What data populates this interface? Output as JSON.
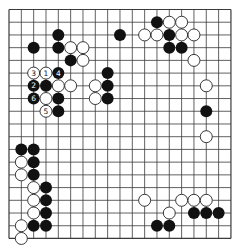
{
  "board": {
    "size": 19,
    "origin": [
      9,
      9.5
    ],
    "spacing": [
      12.33,
      12.72
    ],
    "stone_radius": 6,
    "colors": {
      "background": "#ffffff",
      "line": "#3a3a3a",
      "black_stone": "#111111",
      "white_stone": "#ffffff",
      "white_stroke": "#222222",
      "label_on_black": "#ffffff",
      "label_on_white": "#111111"
    }
  },
  "stones": {
    "black": [
      {
        "col": 12,
        "row": 1
      },
      {
        "col": 4,
        "row": 2
      },
      {
        "col": 9,
        "row": 2
      },
      {
        "col": 13,
        "row": 2
      },
      {
        "col": 2,
        "row": 3
      },
      {
        "col": 4,
        "row": 3
      },
      {
        "col": 13,
        "row": 3
      },
      {
        "col": 14,
        "row": 3
      },
      {
        "col": 5,
        "row": 4
      },
      {
        "col": 4,
        "row": 5,
        "label": "4"
      },
      {
        "col": 8,
        "row": 5
      },
      {
        "col": 2,
        "row": 6,
        "label": "2"
      },
      {
        "col": 3,
        "row": 6
      },
      {
        "col": 8,
        "row": 6
      },
      {
        "col": 2,
        "row": 7,
        "label": "6"
      },
      {
        "col": 4,
        "row": 7
      },
      {
        "col": 8,
        "row": 7
      },
      {
        "col": 4,
        "row": 8
      },
      {
        "col": 16,
        "row": 8
      },
      {
        "col": 1,
        "row": 11
      },
      {
        "col": 2,
        "row": 11
      },
      {
        "col": 2,
        "row": 12
      },
      {
        "col": 2,
        "row": 13
      },
      {
        "col": 3,
        "row": 14
      },
      {
        "col": 3,
        "row": 15
      },
      {
        "col": 3,
        "row": 16
      },
      {
        "col": 15,
        "row": 16
      },
      {
        "col": 16,
        "row": 16
      },
      {
        "col": 17,
        "row": 16
      },
      {
        "col": 2,
        "row": 17
      },
      {
        "col": 3,
        "row": 17
      },
      {
        "col": 12,
        "row": 17
      },
      {
        "col": 13,
        "row": 17
      }
    ],
    "white": [
      {
        "col": 13,
        "row": 1
      },
      {
        "col": 14,
        "row": 1
      },
      {
        "col": 11,
        "row": 2
      },
      {
        "col": 12,
        "row": 2
      },
      {
        "col": 14,
        "row": 2
      },
      {
        "col": 15,
        "row": 2
      },
      {
        "col": 5,
        "row": 3
      },
      {
        "col": 6,
        "row": 3
      },
      {
        "col": 6,
        "row": 4
      },
      {
        "col": 15,
        "row": 4
      },
      {
        "col": 2,
        "row": 5,
        "label": "3"
      },
      {
        "col": 3,
        "row": 5,
        "label": "1"
      },
      {
        "col": 4,
        "row": 6
      },
      {
        "col": 5,
        "row": 6
      },
      {
        "col": 7,
        "row": 6
      },
      {
        "col": 16,
        "row": 6
      },
      {
        "col": 3,
        "row": 7
      },
      {
        "col": 7,
        "row": 7
      },
      {
        "col": 3,
        "row": 8,
        "label": "5"
      },
      {
        "col": 16,
        "row": 10
      },
      {
        "col": 1,
        "row": 12
      },
      {
        "col": 1,
        "row": 13
      },
      {
        "col": 2,
        "row": 14
      },
      {
        "col": 2,
        "row": 15
      },
      {
        "col": 11,
        "row": 15
      },
      {
        "col": 14,
        "row": 15
      },
      {
        "col": 15,
        "row": 15
      },
      {
        "col": 16,
        "row": 15
      },
      {
        "col": 2,
        "row": 16
      },
      {
        "col": 13,
        "row": 16
      },
      {
        "col": 1,
        "row": 17
      },
      {
        "col": 1,
        "row": 18
      }
    ]
  }
}
